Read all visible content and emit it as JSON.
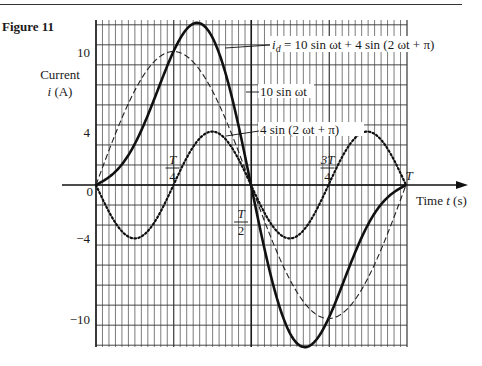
{
  "figure_label": "Figure 11",
  "chart_data": {
    "type": "line",
    "title": "",
    "xlabel": "Time t (s)",
    "ylabel": "Current i (A)",
    "ylabel_line1": "Current",
    "ylabel_line2": "i (A)",
    "xlim": [
      0,
      1
    ],
    "ylim": [
      -12.3,
      12.5
    ],
    "grid": true,
    "y_ticks": [
      {
        "value": 10,
        "label": "10"
      },
      {
        "value": 4,
        "label": "4"
      },
      {
        "value": 0,
        "label": "0"
      },
      {
        "value": -4,
        "label": "−4"
      },
      {
        "value": -10,
        "label": "−10"
      }
    ],
    "x_ticks": [
      {
        "value": 0.25,
        "num": "T",
        "den": "4"
      },
      {
        "value": 0.5,
        "num": "T",
        "den": "2"
      },
      {
        "value": 0.75,
        "num": "3T",
        "den": "4"
      },
      {
        "value": 1.0,
        "label": "T"
      }
    ],
    "x_unit": "T (one period)",
    "series": [
      {
        "name": "i_d = 10 sin ωt + 4 sin (2 ωt + π)",
        "style": "solid-thick",
        "formula": "10*sin(wt) + 4*sin(2wt + pi)",
        "peak": 12.0,
        "trough": -12.0,
        "annotation": "= 10 sin ωt + 4 sin (2 ωt + π)"
      },
      {
        "name": "10 sin ωt",
        "style": "dashed",
        "formula": "10*sin(wt)",
        "peak": 10,
        "trough": -10,
        "annotation": "10 sin ωt"
      },
      {
        "name": "4 sin (2 ωt + π)",
        "style": "dotted",
        "formula": "4*sin(2wt + pi)",
        "peak": 4,
        "trough": -4,
        "annotation": "4 sin (2 ωt + π)"
      }
    ]
  },
  "axis": {
    "time_label": "Time t (s)"
  },
  "labels": {
    "id_sym": "i",
    "id_sub": "d"
  }
}
